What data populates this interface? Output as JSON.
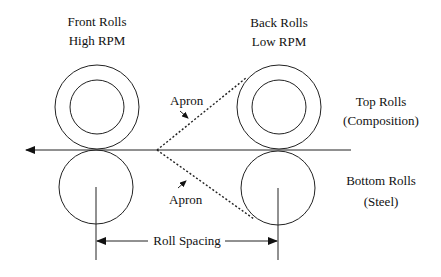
{
  "diagram": {
    "type": "drafting-roll-system",
    "labels": {
      "front_rolls": "Front Rolls",
      "front_speed": "High RPM",
      "back_rolls": "Back Rolls",
      "back_speed": "Low RPM",
      "apron_top": "Apron",
      "apron_bottom": "Apron",
      "top_rolls": "Top Rolls",
      "top_rolls_material": "(Composition)",
      "bottom_rolls": "Bottom Rolls",
      "bottom_rolls_material": "(Steel)",
      "roll_spacing": "Roll Spacing"
    },
    "colors": {
      "stroke": "#222222",
      "background": "#ffffff"
    }
  }
}
